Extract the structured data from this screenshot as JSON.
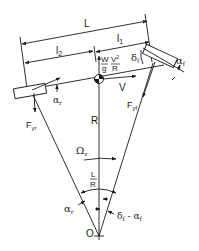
{
  "diagram": {
    "type": "vehicle-cornering-bicycle-model",
    "colors": {
      "line": "#1a1a1a",
      "background": "#ffffff"
    },
    "dimensions": {
      "wheelbase": "L",
      "front_distance": "l",
      "front_distance_sub": "1",
      "rear_distance": "l",
      "rear_distance_sub": "2"
    },
    "forces": {
      "centrifugal_num_left": "W",
      "centrifugal_den_left": "g",
      "centrifugal_num_right": "V",
      "centrifugal_num_right_sup": "2",
      "centrifugal_den_right": "R",
      "velocity": "V",
      "front_lateral": "F",
      "front_lateral_sub": "yf",
      "rear_lateral": "F",
      "rear_lateral_sub": "yr"
    },
    "angles": {
      "front_slip": "α",
      "front_slip_sub": "f",
      "rear_slip": "α",
      "rear_slip_sub": "r",
      "steer": "δ",
      "steer_sub": "f",
      "yaw_rate": "Ω",
      "yaw_rate_sub": "z",
      "ratio_num": "L",
      "ratio_den": "R",
      "bottom_rear": "α",
      "bottom_rear_sub": "r",
      "bottom_front_a": "δ",
      "bottom_front_a_sub": "f",
      "bottom_front_minus": " - α",
      "bottom_front_b_sub": "f"
    },
    "geometry": {
      "radius": "R",
      "center": "O"
    }
  }
}
